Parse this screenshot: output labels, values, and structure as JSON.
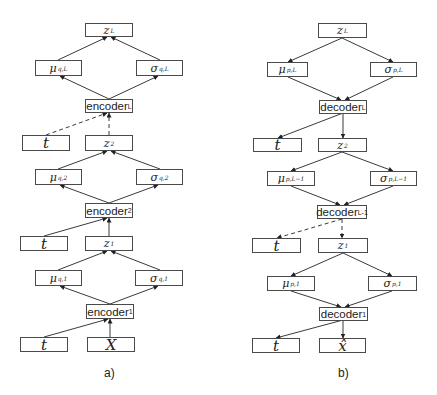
{
  "panel_a": {
    "caption": "a)",
    "nodes": {
      "zL": {
        "base": "z",
        "sub": "L"
      },
      "mu_qL": {
        "base": "μ",
        "sub": "q,L"
      },
      "sigma_qL": {
        "base": "σ",
        "sub": "q,L"
      },
      "encL": {
        "base": "encoder",
        "sub": "L"
      },
      "t3": {
        "base": "t",
        "sub": ""
      },
      "z2": {
        "base": "z",
        "sub": "2"
      },
      "mu_q2": {
        "base": "μ",
        "sub": "q,2"
      },
      "sigma_q2": {
        "base": "σ",
        "sub": "q,2"
      },
      "enc2": {
        "base": "encoder",
        "sub": "2"
      },
      "t2": {
        "base": "t",
        "sub": ""
      },
      "z1": {
        "base": "z",
        "sub": "1"
      },
      "mu_q1": {
        "base": "μ",
        "sub": "q,1"
      },
      "sigma_q1": {
        "base": "σ",
        "sub": "q,1"
      },
      "enc1": {
        "base": "encoder",
        "sub": "1"
      },
      "t1": {
        "base": "t",
        "sub": ""
      },
      "X": {
        "base": "X",
        "sub": ""
      }
    }
  },
  "panel_b": {
    "caption": "b)",
    "nodes": {
      "zL": {
        "base": "z",
        "sub": "L"
      },
      "mu_pL": {
        "base": "μ",
        "sub": "p,L"
      },
      "sigma_pL": {
        "base": "σ",
        "sub": "p,L"
      },
      "decL": {
        "base": "decoder",
        "sub": "L"
      },
      "t3": {
        "base": "t",
        "sub": ""
      },
      "z2": {
        "base": "z",
        "sub": "2"
      },
      "mu_pL1": {
        "base": "μ",
        "sub": "p,L−1"
      },
      "sigma_pL1": {
        "base": "σ",
        "sub": "p,L−1"
      },
      "decL1": {
        "base": "decoder",
        "sub": "L-1"
      },
      "t2": {
        "base": "t",
        "sub": ""
      },
      "z1": {
        "base": "z",
        "sub": "1"
      },
      "mu_p1": {
        "base": "μ",
        "sub": "p,1"
      },
      "sigma_p1": {
        "base": "σ",
        "sub": "p,1"
      },
      "dec1": {
        "base": "decoder",
        "sub": "1"
      },
      "t1": {
        "base": "t",
        "sub": ""
      },
      "xhat": {
        "base": "x̂",
        "sub": ""
      }
    }
  },
  "colors": {
    "line": "#3a3a3a",
    "border": "#4a4a4a",
    "text": "#222222"
  }
}
